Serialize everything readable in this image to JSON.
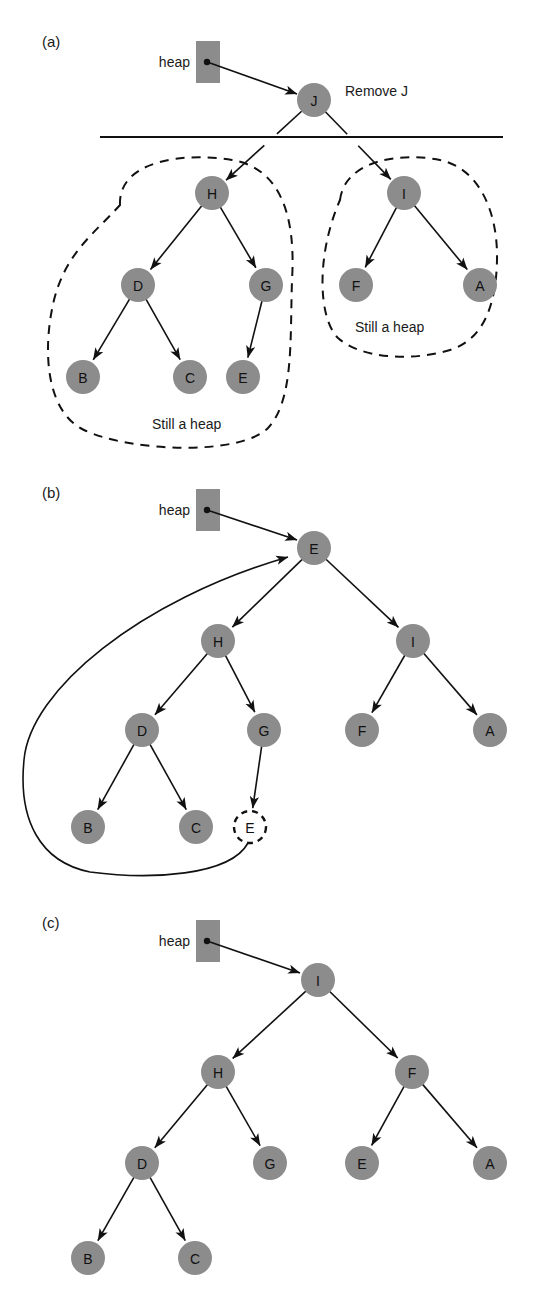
{
  "figure": {
    "background": "#ffffff",
    "node_fill": "#8c8c8c",
    "line_color": "#111111",
    "heap_pointer_label": "heap"
  },
  "panels": [
    {
      "id": "a",
      "label": "(a)",
      "label_x": 42,
      "label_y": 47,
      "heap_label": "heap",
      "heap_label_x": 190,
      "heap_label_y": 62,
      "heap_box": {
        "x": 196,
        "y": 41,
        "w": 24,
        "h": 42
      },
      "heap_dot": {
        "cx": 207,
        "cy": 62,
        "r": 3.2
      },
      "heap_arrow": {
        "x1": 210,
        "y1": 63,
        "x2": 297,
        "y2": 94
      },
      "divider": {
        "x1": 100,
        "y1": 137,
        "x2": 503,
        "y2": 137
      },
      "annotations": [
        {
          "name": "remove-j-label",
          "text": "Remove J",
          "x": 345,
          "y": 91
        },
        {
          "name": "still-a-heap-left-label",
          "text": "Still a heap",
          "x": 152,
          "y": 424
        },
        {
          "name": "still-a-heap-right-label",
          "text": "Still a heap",
          "x": 355,
          "y": 327
        }
      ],
      "nodes": [
        {
          "id": "J",
          "label": "J",
          "cx": 314,
          "cy": 100,
          "r": 17,
          "ghost": false
        },
        {
          "id": "H",
          "label": "H",
          "cx": 212,
          "cy": 193,
          "r": 17,
          "ghost": false
        },
        {
          "id": "I",
          "label": "I",
          "cx": 404,
          "cy": 193,
          "r": 17,
          "ghost": false
        },
        {
          "id": "D",
          "label": "D",
          "cx": 138,
          "cy": 285,
          "r": 17,
          "ghost": false
        },
        {
          "id": "G",
          "label": "G",
          "cx": 266,
          "cy": 285,
          "r": 17,
          "ghost": false
        },
        {
          "id": "F",
          "label": "F",
          "cx": 356,
          "cy": 285,
          "r": 17,
          "ghost": false
        },
        {
          "id": "A",
          "label": "A",
          "cx": 480,
          "cy": 285,
          "r": 17,
          "ghost": false
        },
        {
          "id": "B",
          "label": "B",
          "cx": 83,
          "cy": 377,
          "r": 17,
          "ghost": false
        },
        {
          "id": "C",
          "label": "C",
          "cx": 190,
          "cy": 377,
          "r": 17,
          "ghost": false
        },
        {
          "id": "E",
          "label": "E",
          "cx": 243,
          "cy": 377,
          "r": 17,
          "ghost": false
        }
      ],
      "edges": [
        {
          "from": "J",
          "to": "H",
          "style": "split"
        },
        {
          "from": "J",
          "to": "I",
          "style": "split"
        },
        {
          "from": "H",
          "to": "D",
          "style": "arrow"
        },
        {
          "from": "H",
          "to": "G",
          "style": "arrow"
        },
        {
          "from": "I",
          "to": "F",
          "style": "arrow"
        },
        {
          "from": "I",
          "to": "A",
          "style": "arrow"
        },
        {
          "from": "D",
          "to": "B",
          "style": "arrow"
        },
        {
          "from": "D",
          "to": "C",
          "style": "arrow"
        },
        {
          "from": "G",
          "to": "E",
          "style": "arrow"
        }
      ],
      "regions": [
        {
          "name": "still-a-heap-left-region",
          "path": "M 120 205 C 118 160 185 152 232 160 C 280 168 296 215 292 280 C 290 340 294 400 268 428 C 240 456 130 452 84 430 C 46 412 42 350 54 300 C 66 252 96 232 120 205 Z"
        },
        {
          "name": "still-a-heap-right-region",
          "path": "M 340 200 C 345 160 400 152 440 160 C 478 168 498 210 497 260 C 496 308 482 340 450 350 C 410 362 360 358 338 338 C 318 318 316 255 340 200 Z"
        }
      ]
    },
    {
      "id": "b",
      "label": "(b)",
      "label_x": 42,
      "label_y": 498,
      "heap_label": "heap",
      "heap_label_x": 190,
      "heap_label_y": 510,
      "heap_box": {
        "x": 196,
        "y": 489,
        "w": 24,
        "h": 42
      },
      "heap_dot": {
        "cx": 207,
        "cy": 510,
        "r": 3.2
      },
      "heap_arrow": {
        "x1": 210,
        "y1": 511,
        "x2": 297,
        "y2": 540
      },
      "annotations": [],
      "nodes": [
        {
          "id": "E_root",
          "label": "E",
          "cx": 314,
          "cy": 548,
          "r": 17,
          "ghost": false
        },
        {
          "id": "H",
          "label": "H",
          "cx": 218,
          "cy": 641,
          "r": 17,
          "ghost": false
        },
        {
          "id": "I",
          "label": "I",
          "cx": 413,
          "cy": 641,
          "r": 17,
          "ghost": false
        },
        {
          "id": "D",
          "label": "D",
          "cx": 142,
          "cy": 730,
          "r": 17,
          "ghost": false
        },
        {
          "id": "G",
          "label": "G",
          "cx": 264,
          "cy": 730,
          "r": 17,
          "ghost": false
        },
        {
          "id": "F",
          "label": "F",
          "cx": 362,
          "cy": 730,
          "r": 17,
          "ghost": false
        },
        {
          "id": "A",
          "label": "A",
          "cx": 490,
          "cy": 730,
          "r": 17,
          "ghost": false
        },
        {
          "id": "B",
          "label": "B",
          "cx": 88,
          "cy": 827,
          "r": 17,
          "ghost": false
        },
        {
          "id": "C",
          "label": "C",
          "cx": 196,
          "cy": 827,
          "r": 17,
          "ghost": false
        },
        {
          "id": "E_leaf",
          "label": "E",
          "cx": 250,
          "cy": 827,
          "r": 16,
          "ghost": true
        }
      ],
      "edges": [
        {
          "from": "E_root",
          "to": "H",
          "style": "arrow"
        },
        {
          "from": "E_root",
          "to": "I",
          "style": "arrow"
        },
        {
          "from": "H",
          "to": "D",
          "style": "arrow"
        },
        {
          "from": "H",
          "to": "G",
          "style": "arrow"
        },
        {
          "from": "I",
          "to": "F",
          "style": "arrow"
        },
        {
          "from": "I",
          "to": "A",
          "style": "arrow"
        },
        {
          "from": "D",
          "to": "B",
          "style": "arrow"
        },
        {
          "from": "D",
          "to": "C",
          "style": "arrow"
        },
        {
          "from": "G",
          "to": "E_leaf",
          "style": "arrow"
        }
      ],
      "swap_curve": {
        "name": "swap-curve",
        "path": "M 248 843 C 230 876 150 880 90 872 C 40 862 18 820 24 760 C 30 690 140 600 288 557"
      }
    },
    {
      "id": "c",
      "label": "(c)",
      "label_x": 42,
      "label_y": 928,
      "heap_label": "heap",
      "heap_label_x": 190,
      "heap_label_y": 941,
      "heap_box": {
        "x": 196,
        "y": 920,
        "w": 24,
        "h": 42
      },
      "heap_dot": {
        "cx": 207,
        "cy": 941,
        "r": 3.2
      },
      "heap_arrow": {
        "x1": 210,
        "y1": 942,
        "x2": 300,
        "y2": 973
      },
      "annotations": [],
      "nodes": [
        {
          "id": "I",
          "label": "I",
          "cx": 318,
          "cy": 980,
          "r": 17,
          "ghost": false
        },
        {
          "id": "H",
          "label": "H",
          "cx": 218,
          "cy": 1072,
          "r": 17,
          "ghost": false
        },
        {
          "id": "F",
          "label": "F",
          "cx": 412,
          "cy": 1072,
          "r": 17,
          "ghost": false
        },
        {
          "id": "D",
          "label": "D",
          "cx": 142,
          "cy": 1163,
          "r": 17,
          "ghost": false
        },
        {
          "id": "G",
          "label": "G",
          "cx": 270,
          "cy": 1163,
          "r": 17,
          "ghost": false
        },
        {
          "id": "E",
          "label": "E",
          "cx": 362,
          "cy": 1163,
          "r": 17,
          "ghost": false
        },
        {
          "id": "A",
          "label": "A",
          "cx": 490,
          "cy": 1163,
          "r": 17,
          "ghost": false
        },
        {
          "id": "B",
          "label": "B",
          "cx": 88,
          "cy": 1258,
          "r": 17,
          "ghost": false
        },
        {
          "id": "C",
          "label": "C",
          "cx": 195,
          "cy": 1258,
          "r": 17,
          "ghost": false
        }
      ],
      "edges": [
        {
          "from": "I",
          "to": "H",
          "style": "arrow"
        },
        {
          "from": "I",
          "to": "F",
          "style": "arrow"
        },
        {
          "from": "H",
          "to": "D",
          "style": "arrow"
        },
        {
          "from": "H",
          "to": "G",
          "style": "arrow"
        },
        {
          "from": "F",
          "to": "E",
          "style": "arrow"
        },
        {
          "from": "F",
          "to": "A",
          "style": "arrow"
        },
        {
          "from": "D",
          "to": "B",
          "style": "arrow"
        },
        {
          "from": "D",
          "to": "C",
          "style": "arrow"
        }
      ]
    }
  ]
}
